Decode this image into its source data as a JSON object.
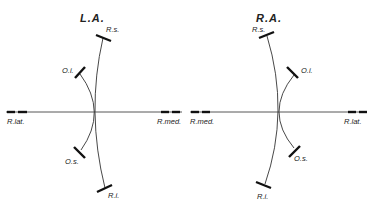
{
  "diagrams": [
    {
      "title": "L.A.",
      "labels": {
        "superior_rectus": "R.s.",
        "inferior_rectus": "R.i.",
        "inferior_oblique": "O.i.",
        "superior_oblique": "O.s.",
        "left_end": "R.lat.",
        "right_end": "R.med."
      }
    },
    {
      "title": "R.A.",
      "labels": {
        "superior_rectus": "R.s.",
        "inferior_rectus": "R.i.",
        "inferior_oblique": "O.i.",
        "superior_oblique": "O.s.",
        "left_end": "R.med.",
        "right_end": "R.lat."
      }
    }
  ],
  "colors": {
    "line": "#333333",
    "bar": "#111111",
    "text": "#222222",
    "background": "#ffffff"
  }
}
